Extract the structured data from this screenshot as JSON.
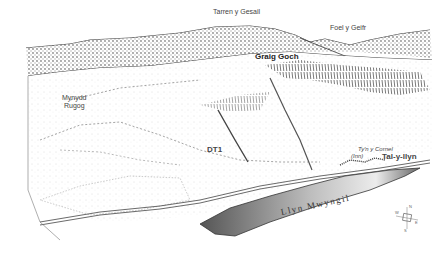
{
  "figure": {
    "type": "landscape-sketch",
    "labels": {
      "tarren": "Tarren y Gesail",
      "foel": "Foel y Geifr",
      "graig": "Graig Goch",
      "mynydd_line1": "Mynydd",
      "mynydd_line2": "Rugog",
      "dt1": "DT1",
      "tyn": "Ty'n y Cornel",
      "inn": "(Inn)",
      "taly": "Tal-y-llyn",
      "llyn": "Llyn Mwyngil"
    },
    "compass": {
      "label": "compass-rose",
      "points": [
        "N",
        "E",
        "S",
        "W"
      ]
    },
    "colors": {
      "ink": "#222222",
      "lake_dark": "#555555",
      "lake_light": "#e8e8e8",
      "forest": "#8a8a8a"
    }
  }
}
